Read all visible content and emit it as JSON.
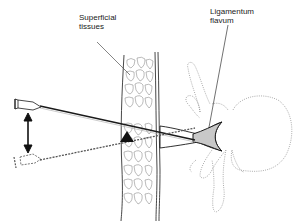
{
  "diagram": {
    "labels": {
      "superficial_tissues": "Superficial\ntissues",
      "ligamentum_flavum": "Ligamentum\nflavum"
    },
    "elements": {
      "needle_solid": "Needle (initial position, solid outline)",
      "needle_dashed": "Needle (redirected position, dashed outline)",
      "pivot_marker": "Pivot point triangle at skin surface",
      "direction_arrow": "Double-headed vertical arrow indicating angle change",
      "tissue_band": "Superficial tissue layer (cellular pattern)",
      "ligament": "Ligamentum flavum (grey shaded)",
      "vertebra": "Vertebra (dotted outline)"
    },
    "colors": {
      "line": "#1a1a1a",
      "ligament_fill": "#c8c8c8",
      "dotted": "#888888",
      "background": "#ffffff"
    }
  }
}
